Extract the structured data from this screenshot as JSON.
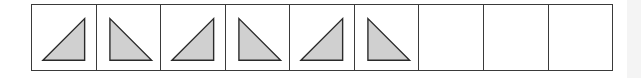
{
  "diagram": {
    "colors": {
      "border": "#3a3a3a",
      "triangle_fill": "#d0d0d0",
      "triangle_stroke": "#2a2a2a",
      "background": "#ffffff"
    },
    "cells": [
      {
        "index": 1,
        "content": "triangle",
        "orientation": "right-angle-bottom-right"
      },
      {
        "index": 2,
        "content": "triangle",
        "orientation": "right-angle-bottom-left"
      },
      {
        "index": 3,
        "content": "triangle",
        "orientation": "right-angle-bottom-right"
      },
      {
        "index": 4,
        "content": "triangle",
        "orientation": "right-angle-bottom-left"
      },
      {
        "index": 5,
        "content": "triangle",
        "orientation": "right-angle-bottom-right"
      },
      {
        "index": 6,
        "content": "triangle",
        "orientation": "right-angle-bottom-left"
      },
      {
        "index": 7,
        "content": "empty"
      },
      {
        "index": 8,
        "content": "empty"
      },
      {
        "index": 9,
        "content": "empty"
      }
    ]
  }
}
